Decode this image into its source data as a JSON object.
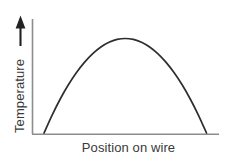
{
  "figure": {
    "background_color": "#ffffff",
    "axis_color": "#8d8d8d",
    "curve_color": "#2e2e2e",
    "text_color": "#3a3a3a",
    "arrow_color": "#222222"
  },
  "axes": {
    "y_label": "Temperature",
    "x_label": "Position on wire",
    "y_arrow_icon": "up-arrow-icon",
    "y_axis_icon": "vertical-axis-line",
    "x_axis_icon": "horizontal-axis-line"
  },
  "chart_data": {
    "type": "line",
    "title": "",
    "xlabel": "Position on wire",
    "ylabel": "Temperature",
    "grid": false,
    "legend": "none",
    "xlim": [
      0,
      1
    ],
    "ylim": [
      0,
      1
    ],
    "axis_ticks": [],
    "series": [
      {
        "name": "Temperature along wire",
        "shape": "parabola",
        "x": [
          0.0,
          0.05,
          0.1,
          0.15,
          0.2,
          0.25,
          0.3,
          0.35,
          0.4,
          0.45,
          0.5,
          0.55,
          0.6,
          0.65,
          0.7,
          0.75,
          0.8,
          0.85,
          0.9,
          0.95,
          1.0
        ],
        "y": [
          0.0,
          0.19,
          0.36,
          0.51,
          0.64,
          0.75,
          0.84,
          0.91,
          0.96,
          0.99,
          1.0,
          0.99,
          0.96,
          0.91,
          0.84,
          0.75,
          0.64,
          0.51,
          0.36,
          0.19,
          0.0
        ]
      }
    ],
    "annotations": []
  }
}
